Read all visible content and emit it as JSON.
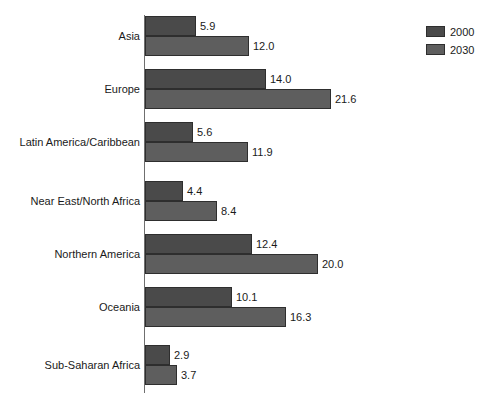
{
  "chart_data": {
    "type": "bar",
    "orientation": "horizontal",
    "title": "",
    "subtitle": "",
    "xlabel": "",
    "ylabel": "",
    "grid": false,
    "legend_position": "top-right",
    "xlim": [
      0,
      21.6
    ],
    "categories": [
      "Asia",
      "Europe",
      "Latin America/Caribbean",
      "Near East/North Africa",
      "Northern America",
      "Oceania",
      "Sub-Saharan Africa"
    ],
    "series": [
      {
        "name": "2000",
        "color": "#4a4a4a",
        "values": [
          5.9,
          14.0,
          5.6,
          4.4,
          12.4,
          10.1,
          2.9
        ],
        "labels": [
          "5.9",
          "14.0",
          "5.6",
          "4.4",
          "12.4",
          "10.1",
          "2.9"
        ]
      },
      {
        "name": "2030",
        "color": "#5e5e5e",
        "values": [
          12.0,
          21.6,
          11.9,
          8.4,
          20.0,
          16.3,
          3.7
        ],
        "labels": [
          "12.0",
          "21.6",
          "11.9",
          "8.4",
          "20.0",
          "16.3",
          "3.7"
        ]
      }
    ]
  },
  "legend": {
    "items": [
      {
        "label": "2000",
        "swatch": "legend-swatch-2000"
      },
      {
        "label": "2030",
        "swatch": "legend-swatch-2030"
      }
    ]
  },
  "groups": [
    {
      "category": "Asia",
      "bars": [
        {
          "series": "2000",
          "value": 5.9,
          "label": "5.9"
        },
        {
          "series": "2030",
          "value": 12.0,
          "label": "12.0"
        }
      ]
    },
    {
      "category": "Europe",
      "bars": [
        {
          "series": "2000",
          "value": 14.0,
          "label": "14.0"
        },
        {
          "series": "2030",
          "value": 21.6,
          "label": "21.6"
        }
      ]
    },
    {
      "category": "Latin America/Caribbean",
      "bars": [
        {
          "series": "2000",
          "value": 5.6,
          "label": "5.6"
        },
        {
          "series": "2030",
          "value": 11.9,
          "label": "11.9"
        }
      ]
    },
    {
      "category": "Near East/North Africa",
      "bars": [
        {
          "series": "2000",
          "value": 4.4,
          "label": "4.4"
        },
        {
          "series": "2030",
          "value": 8.4,
          "label": "8.4"
        }
      ]
    },
    {
      "category": "Northern America",
      "bars": [
        {
          "series": "2000",
          "value": 12.4,
          "label": "12.4"
        },
        {
          "series": "2030",
          "value": 20.0,
          "label": "20.0"
        }
      ]
    },
    {
      "category": "Oceania",
      "bars": [
        {
          "series": "2000",
          "value": 10.1,
          "label": "10.1"
        },
        {
          "series": "2030",
          "value": 16.3,
          "label": "16.3"
        }
      ]
    },
    {
      "category": "Sub-Saharan Africa",
      "bars": [
        {
          "series": "2000",
          "value": 2.9,
          "label": "2.9"
        },
        {
          "series": "2030",
          "value": 3.7,
          "label": "3.7"
        }
      ]
    }
  ],
  "layout": {
    "px_per_unit": 8.63,
    "group_top_offsets": [
      16,
      69,
      122,
      181,
      234,
      287,
      345
    ],
    "bar_height": 20
  }
}
